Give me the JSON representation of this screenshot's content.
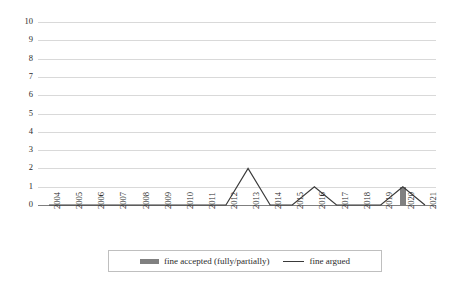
{
  "chart_data": {
    "type": "line",
    "title": "",
    "xlabel": "",
    "ylabel": "",
    "ylim": [
      0,
      10
    ],
    "ytick_step": 1,
    "grid": true,
    "legend_position": "bottom",
    "categories": [
      "2004",
      "2005",
      "2006",
      "2007",
      "2008",
      "2009",
      "2010",
      "2011",
      "2012",
      "2013",
      "2014",
      "2015",
      "2016",
      "2017",
      "2018",
      "2019",
      "2020",
      "2021"
    ],
    "ytick_labels": [
      "10",
      "9",
      "8",
      "7",
      "6",
      "5",
      "4",
      "3",
      "2",
      "1",
      "0"
    ],
    "series": [
      {
        "name": "fine accepted (fully/partially)",
        "type": "bar",
        "color": "#808080",
        "values": [
          0,
          0,
          0,
          0,
          0,
          0,
          0,
          0,
          0,
          0,
          0,
          0,
          0,
          0,
          0,
          0,
          1,
          0
        ]
      },
      {
        "name": "fine argued",
        "type": "line",
        "color": "#3a3a3a",
        "values": [
          0,
          0,
          0,
          0,
          0,
          0,
          0,
          0,
          0,
          2,
          0,
          0,
          1,
          0,
          0,
          0,
          1,
          0
        ]
      }
    ]
  },
  "legend": {
    "items": [
      {
        "label": "fine accepted (fully/partially)",
        "marker": "bar-swatch"
      },
      {
        "label": "fine argued",
        "marker": "line-swatch"
      }
    ]
  }
}
